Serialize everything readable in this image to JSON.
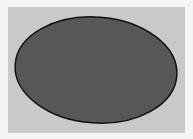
{
  "background": {
    "outer_color": "#f4f4f4",
    "canvas_color": "#c9c9c9"
  },
  "shape": {
    "type": "ellipse",
    "cx": 96,
    "cy": 70,
    "rx": 81,
    "ry": 53,
    "rotation_deg": 4,
    "fill": "#575757",
    "stroke": "#111111",
    "stroke_width": 1.5
  }
}
